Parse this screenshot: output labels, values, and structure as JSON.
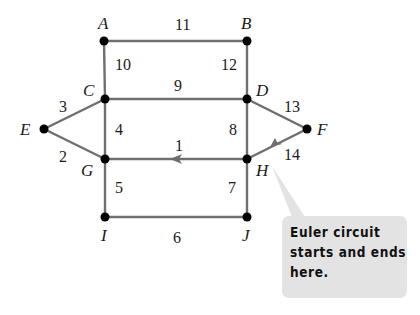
{
  "diagram": {
    "colors": {
      "edge": "#6f6f6f",
      "node": "#000000",
      "callout_bg": "#e3e3e3",
      "text": "#1a1a1a"
    },
    "vertices": [
      {
        "id": "A",
        "label": "A",
        "x": 104,
        "y": 41
      },
      {
        "id": "B",
        "label": "B",
        "x": 247,
        "y": 41
      },
      {
        "id": "C",
        "label": "C",
        "x": 105,
        "y": 99
      },
      {
        "id": "D",
        "label": "D",
        "x": 247,
        "y": 99
      },
      {
        "id": "E",
        "label": "E",
        "x": 44,
        "y": 129
      },
      {
        "id": "F",
        "label": "F",
        "x": 307,
        "y": 129
      },
      {
        "id": "G",
        "label": "G",
        "x": 105,
        "y": 159
      },
      {
        "id": "H",
        "label": "H",
        "x": 247,
        "y": 159
      },
      {
        "id": "I",
        "label": "I",
        "x": 105,
        "y": 217
      },
      {
        "id": "J",
        "label": "J",
        "x": 247,
        "y": 217
      }
    ],
    "edges": [
      {
        "from": "H",
        "to": "G",
        "order": "1",
        "directed": true
      },
      {
        "from": "G",
        "to": "E",
        "order": "2"
      },
      {
        "from": "E",
        "to": "C",
        "order": "3"
      },
      {
        "from": "C",
        "to": "G",
        "order": "4"
      },
      {
        "from": "G",
        "to": "I",
        "order": "5"
      },
      {
        "from": "I",
        "to": "J",
        "order": "6"
      },
      {
        "from": "J",
        "to": "H",
        "order": "7"
      },
      {
        "from": "H",
        "to": "D",
        "order": "8"
      },
      {
        "from": "D",
        "to": "C",
        "order": "9"
      },
      {
        "from": "C",
        "to": "A",
        "order": "10"
      },
      {
        "from": "A",
        "to": "B",
        "order": "11"
      },
      {
        "from": "B",
        "to": "D",
        "order": "12"
      },
      {
        "from": "D",
        "to": "F",
        "order": "13"
      },
      {
        "from": "F",
        "to": "H",
        "order": "14",
        "directed": true
      }
    ],
    "edge_labels": {
      "e1": "1",
      "e2": "2",
      "e3": "3",
      "e4": "4",
      "e5": "5",
      "e6": "6",
      "e7": "7",
      "e8": "8",
      "e9": "9",
      "e10": "10",
      "e11": "11",
      "e12": "12",
      "e13": "13",
      "e14": "14"
    },
    "vertex_labels": {
      "A": "A",
      "B": "B",
      "C": "C",
      "D": "D",
      "E": "E",
      "F": "F",
      "G": "G",
      "H": "H",
      "I": "I",
      "J": "J"
    },
    "callout": {
      "line1": "Euler circuit",
      "line2": "starts and ends",
      "line3": "here.",
      "points_to": "H"
    }
  }
}
